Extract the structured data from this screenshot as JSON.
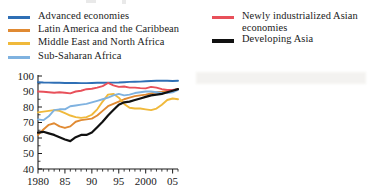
{
  "legend": {
    "left_column": [
      {
        "label": "Advanced economies",
        "color": "#2f6fb5",
        "weight": "normal",
        "swatch_name": "legend-swatch-advanced-economies"
      },
      {
        "label": "Latin America and the Caribbean",
        "color": "#e08a33",
        "weight": "normal",
        "swatch_name": "legend-swatch-latin-america"
      },
      {
        "label": "Middle East and North Africa",
        "color": "#f0b93b",
        "weight": "normal",
        "swatch_name": "legend-swatch-middle-east"
      },
      {
        "label": "Sub-Saharan Africa",
        "color": "#7fb2e0",
        "weight": "normal",
        "swatch_name": "legend-swatch-sub-saharan-africa"
      }
    ],
    "right_column": [
      {
        "label": "Newly industrialized Asian\neconomies",
        "color": "#e8505a",
        "weight": "normal",
        "swatch_name": "legend-swatch-newly-industrialized-asia"
      },
      {
        "label": "Developing Asia",
        "color": "#111111",
        "weight": "thick",
        "swatch_name": "legend-swatch-developing-asia"
      }
    ]
  },
  "axes": {
    "y_ticks": [
      "100",
      "90",
      "80",
      "70",
      "60",
      "50",
      "40"
    ],
    "x_ticks": [
      "1980",
      "85",
      "90",
      "95",
      "2000",
      "05"
    ],
    "y_min": 40,
    "y_max": 100,
    "x_min": 1980,
    "x_max": 2006
  },
  "chart_data": {
    "type": "line",
    "title": "",
    "subtitle": "",
    "xlabel": "",
    "ylabel": "",
    "xlim": [
      1980,
      2006
    ],
    "ylim": [
      40,
      100
    ],
    "y_ticks": [
      40,
      50,
      60,
      70,
      80,
      90,
      100
    ],
    "x_ticks": [
      1980,
      1985,
      1990,
      1995,
      2000,
      2005
    ],
    "x_tick_labels": [
      "1980",
      "85",
      "90",
      "95",
      "2000",
      "05"
    ],
    "grid": false,
    "legend_position": "above",
    "x": [
      1980,
      1981,
      1982,
      1983,
      1984,
      1985,
      1986,
      1987,
      1988,
      1989,
      1990,
      1991,
      1992,
      1993,
      1994,
      1995,
      1996,
      1997,
      1998,
      1999,
      2000,
      2001,
      2002,
      2003,
      2004,
      2005,
      2006
    ],
    "series": [
      {
        "name": "Advanced economies",
        "color": "#2f6fb5",
        "values": [
          96.0,
          95.8,
          95.7,
          95.6,
          95.6,
          95.5,
          95.5,
          95.5,
          95.4,
          95.4,
          95.5,
          95.6,
          95.6,
          95.6,
          95.7,
          95.8,
          96.0,
          96.2,
          96.3,
          96.4,
          96.6,
          96.8,
          96.9,
          96.9,
          96.9,
          96.8,
          96.9
        ]
      },
      {
        "name": "Latin America and the Caribbean",
        "color": "#e08a33",
        "values": [
          62.0,
          65.5,
          68.5,
          69.5,
          67.5,
          66.5,
          67.5,
          70.5,
          71.5,
          72.0,
          72.5,
          74.5,
          77.5,
          80.5,
          82.0,
          83.5,
          85.0,
          86.0,
          87.0,
          87.5,
          88.0,
          88.8,
          89.5,
          89.8,
          90.2,
          90.8,
          91.5
        ]
      },
      {
        "name": "Middle East and North Africa",
        "color": "#f0b93b",
        "values": [
          76.5,
          77.0,
          77.5,
          78.0,
          77.5,
          76.0,
          74.5,
          73.5,
          73.0,
          73.5,
          75.0,
          78.5,
          83.5,
          88.0,
          88.5,
          86.0,
          82.0,
          79.5,
          79.0,
          79.0,
          78.5,
          78.0,
          79.0,
          81.5,
          84.5,
          85.5,
          85.0
        ]
      },
      {
        "name": "Sub-Saharan Africa",
        "color": "#7fb2e0",
        "values": [
          72.0,
          71.5,
          74.0,
          78.0,
          78.5,
          78.5,
          80.5,
          81.0,
          81.5,
          82.0,
          83.0,
          84.0,
          85.0,
          86.0,
          87.5,
          88.5,
          87.5,
          88.0,
          89.0,
          89.5,
          90.0,
          90.0,
          89.5,
          89.0,
          89.0,
          89.5,
          91.0
        ]
      },
      {
        "name": "Newly industrialized Asian economies",
        "color": "#e8505a",
        "values": [
          90.0,
          89.8,
          89.5,
          89.2,
          89.5,
          89.2,
          88.8,
          90.0,
          90.5,
          91.5,
          91.8,
          92.5,
          93.5,
          95.5,
          94.0,
          93.0,
          93.2,
          92.5,
          92.5,
          92.2,
          92.0,
          93.0,
          92.5,
          91.5,
          91.0,
          91.0,
          91.5
        ]
      },
      {
        "name": "Developing Asia",
        "color": "#111111",
        "values": [
          63.5,
          64.0,
          63.0,
          62.0,
          60.5,
          59.0,
          58.0,
          60.5,
          62.0,
          62.0,
          63.5,
          67.0,
          70.5,
          74.5,
          78.0,
          81.5,
          83.0,
          83.5,
          84.5,
          85.5,
          86.5,
          87.5,
          88.0,
          88.5,
          89.5,
          90.5,
          91.5
        ]
      }
    ]
  }
}
